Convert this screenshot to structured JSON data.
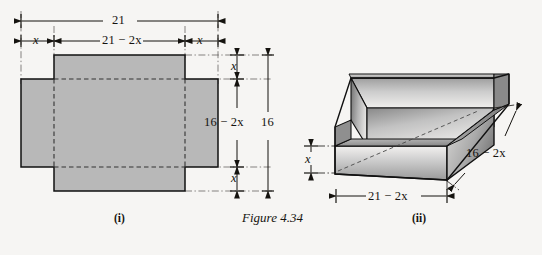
{
  "figure": {
    "caption": "Figure 4.34",
    "background_color": "#f6f5f3",
    "ink_color": "#15130f",
    "fill_gray": "#b8b8b8"
  },
  "panels": [
    {
      "id": "i",
      "label": "(i)",
      "kind": "flat-pattern-net",
      "description": "Rectangular sheet with square corners removed, cross shape",
      "dimensions": {
        "overall_width": "21",
        "overall_height": "16",
        "inner_width": "21 − 2x",
        "inner_height": "16 − 2x",
        "corner_cut_left": "x",
        "corner_cut_right": "x",
        "corner_cut_top": "x",
        "corner_cut_bottom": "x"
      }
    },
    {
      "id": "ii",
      "label": "(ii)",
      "kind": "open-box-3d",
      "description": "Open topped box folded from the net",
      "dimensions": {
        "height": "x",
        "length": "21 − 2x",
        "depth": "16 − 2x"
      }
    }
  ],
  "labels": {
    "top_overall": "21",
    "top_left_x": "x",
    "top_inner": "21 − 2x",
    "top_right_x": "x",
    "right_top_x": "x",
    "right_inner": "16 − 2x",
    "right_bottom_x": "x",
    "right_overall": "16",
    "box_height_x": "x",
    "box_length": "21 − 2x",
    "box_depth": "16 − 2x",
    "panel_i": "(i)",
    "panel_ii": "(ii)",
    "caption": "Figure 4.34"
  }
}
